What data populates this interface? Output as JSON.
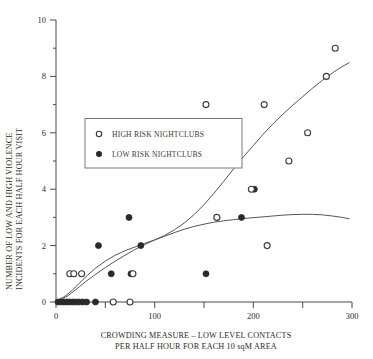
{
  "chart_data": {
    "type": "scatter",
    "title": "",
    "xlabel": "CROWDING MEASURE – LOW LEVEL CONTACTS PER HALF HOUR FOR EACH 10 sqM AREA",
    "xlabel_line1": "CROWDING MEASURE – LOW LEVEL CONTACTS",
    "xlabel_line2": "PER HALF HOUR FOR EACH 10 sqM AREA",
    "ylabel": "NUMBER OF LOW AND HIGH VIOLENCE INCIDENTS FOR EACH HALF HOUR VISIT",
    "ylabel_line1": "NUMBER OF LOW AND HIGH VIOLENCE",
    "ylabel_line2": "INCIDENTS FOR EACH HALF HOUR VISIT",
    "xlim": [
      0,
      300
    ],
    "ylim": [
      0,
      10
    ],
    "xticks": [
      0,
      50,
      100,
      150,
      200,
      250,
      300
    ],
    "xtick_labels": [
      "0",
      "",
      "100",
      "",
      "200",
      "",
      "300"
    ],
    "yticks": [
      0,
      1,
      2,
      3,
      4,
      5,
      6,
      7,
      8,
      9,
      10
    ],
    "ytick_labels": [
      "0",
      "",
      "2",
      "",
      "4",
      "",
      "6",
      "",
      "8",
      "",
      "10"
    ],
    "grid": false,
    "legend_position": "upper-left-inset",
    "series": [
      {
        "name": "HIGH RISK NIGHTCLUBS",
        "marker": "open-circle",
        "color": "#3a3a3a",
        "points": [
          [
            14,
            1
          ],
          [
            18,
            1
          ],
          [
            26,
            1
          ],
          [
            58,
            0
          ],
          [
            75,
            0
          ],
          [
            78,
            1
          ],
          [
            152,
            7
          ],
          [
            163,
            3
          ],
          [
            198,
            4
          ],
          [
            211,
            7
          ],
          [
            214,
            2
          ],
          [
            236,
            5
          ],
          [
            255,
            6
          ],
          [
            274,
            8
          ],
          [
            283,
            9
          ]
        ]
      },
      {
        "name": "LOW RISK NIGHTCLUBS",
        "marker": "filled-circle",
        "color": "#2a2a2a",
        "points": [
          [
            2,
            0
          ],
          [
            5,
            0
          ],
          [
            8,
            0
          ],
          [
            11,
            0
          ],
          [
            14,
            0
          ],
          [
            17,
            0
          ],
          [
            20,
            0
          ],
          [
            23,
            0
          ],
          [
            27,
            0
          ],
          [
            31,
            0
          ],
          [
            40,
            0
          ],
          [
            43,
            2
          ],
          [
            56,
            1
          ],
          [
            74,
            3
          ],
          [
            76,
            1
          ],
          [
            86,
            2
          ],
          [
            152,
            1
          ],
          [
            188,
            3
          ],
          [
            201,
            4
          ]
        ]
      }
    ],
    "curves": [
      {
        "name": "high-risk-fit",
        "description": "rising sigmoid fitted curve for high risk nightclubs",
        "points": [
          [
            1,
            0.05
          ],
          [
            6,
            0.1
          ],
          [
            12,
            0.22
          ],
          [
            18,
            0.38
          ],
          [
            24,
            0.55
          ],
          [
            30,
            0.72
          ],
          [
            40,
            0.98
          ],
          [
            50,
            1.22
          ],
          [
            60,
            1.45
          ],
          [
            70,
            1.66
          ],
          [
            80,
            1.86
          ],
          [
            90,
            2.04
          ],
          [
            100,
            2.2
          ],
          [
            110,
            2.36
          ],
          [
            120,
            2.56
          ],
          [
            130,
            2.8
          ],
          [
            140,
            3.1
          ],
          [
            150,
            3.45
          ],
          [
            160,
            3.85
          ],
          [
            170,
            4.28
          ],
          [
            180,
            4.72
          ],
          [
            190,
            5.15
          ],
          [
            200,
            5.55
          ],
          [
            210,
            5.95
          ],
          [
            220,
            6.32
          ],
          [
            230,
            6.66
          ],
          [
            240,
            6.98
          ],
          [
            250,
            7.28
          ],
          [
            260,
            7.58
          ],
          [
            270,
            7.86
          ],
          [
            280,
            8.12
          ],
          [
            290,
            8.35
          ],
          [
            297,
            8.48
          ]
        ]
      },
      {
        "name": "low-risk-fit",
        "description": "saturating fitted curve for low risk nightclubs peaking near 3",
        "points": [
          [
            1,
            0.06
          ],
          [
            8,
            0.18
          ],
          [
            16,
            0.4
          ],
          [
            24,
            0.68
          ],
          [
            32,
            0.95
          ],
          [
            40,
            1.2
          ],
          [
            50,
            1.45
          ],
          [
            60,
            1.66
          ],
          [
            70,
            1.82
          ],
          [
            80,
            1.95
          ],
          [
            90,
            2.08
          ],
          [
            100,
            2.2
          ],
          [
            110,
            2.33
          ],
          [
            120,
            2.46
          ],
          [
            130,
            2.58
          ],
          [
            140,
            2.68
          ],
          [
            150,
            2.76
          ],
          [
            160,
            2.83
          ],
          [
            170,
            2.88
          ],
          [
            180,
            2.92
          ],
          [
            190,
            2.96
          ],
          [
            200,
            2.99
          ],
          [
            210,
            3.02
          ],
          [
            220,
            3.05
          ],
          [
            230,
            3.08
          ],
          [
            240,
            3.1
          ],
          [
            250,
            3.11
          ],
          [
            260,
            3.11
          ],
          [
            270,
            3.09
          ],
          [
            280,
            3.05
          ],
          [
            290,
            3.0
          ],
          [
            297,
            2.95
          ]
        ]
      }
    ]
  },
  "legend": {
    "items": [
      {
        "label": "HIGH RISK NIGHTCLUBS",
        "marker": "open-circle"
      },
      {
        "label": "LOW RISK NIGHTCLUBS",
        "marker": "filled-circle"
      }
    ]
  }
}
